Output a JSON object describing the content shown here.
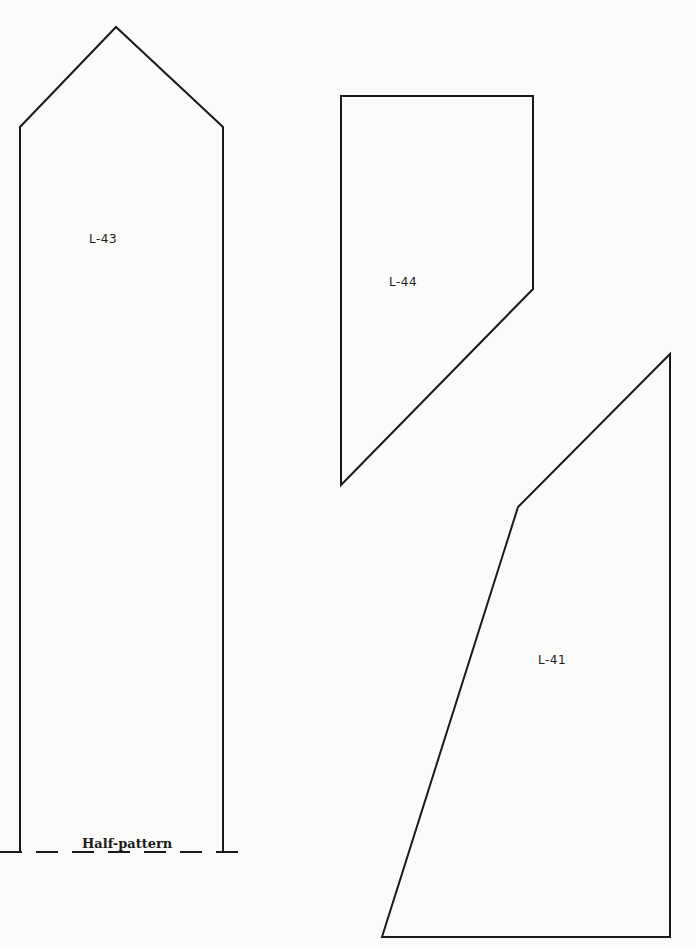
{
  "pieces": [
    {
      "id": "L-43",
      "label": "L-43",
      "points": "20,127 116,27 223,127 223,852 20,852",
      "label_pos": [
        89,
        232
      ]
    },
    {
      "id": "L-44",
      "label": "L-44",
      "points": "341,96 533,96 533,289 341,485",
      "label_pos": [
        389,
        275
      ]
    },
    {
      "id": "L-41",
      "label": "L-41",
      "points": "670,354 670,937 382,937 518,507",
      "label_pos": [
        538,
        653
      ]
    }
  ],
  "fold": {
    "note": "Half-pattern",
    "line": [
      0,
      852,
      240,
      852
    ],
    "note_pos": [
      82,
      836
    ]
  },
  "colors": {
    "stroke": "#1a1a1a",
    "background": "#fbfbfa"
  }
}
